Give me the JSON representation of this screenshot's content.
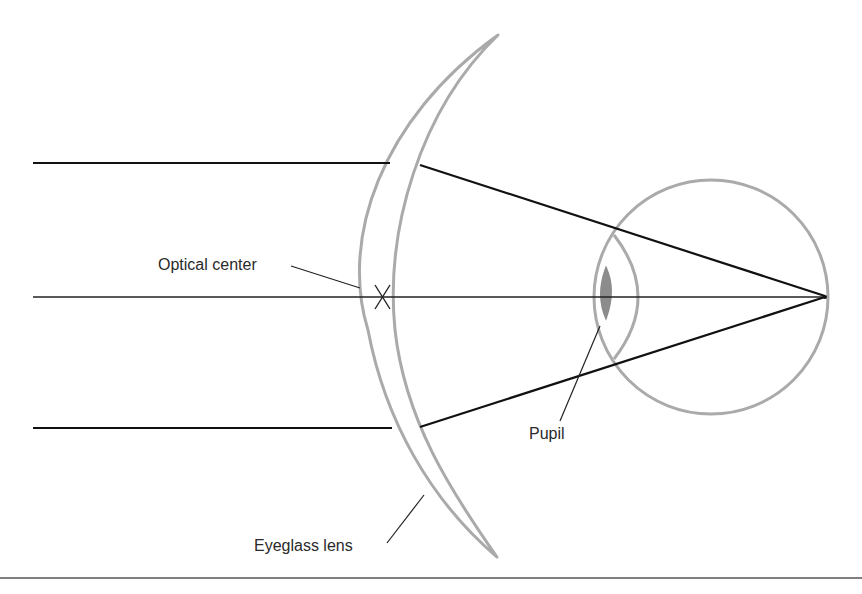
{
  "figure": {
    "labels": {
      "optical_center": "Optical center",
      "pupil": "Pupil",
      "eyeglass_lens": "Eyeglass lens"
    },
    "colors": {
      "ray": "#111111",
      "structure": "#aaaaaa",
      "pupil_fill": "#8c8c8c",
      "text": "#2a2a2a",
      "rule": "#555555"
    }
  }
}
